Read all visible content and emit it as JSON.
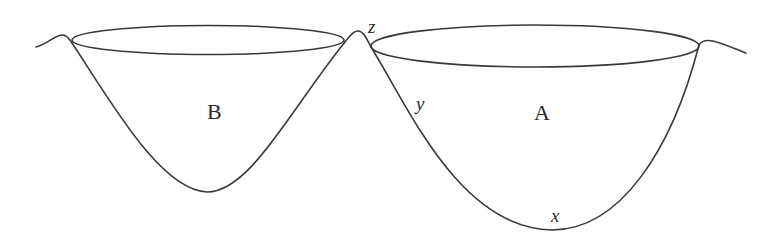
{
  "diagram": {
    "regions": [
      {
        "id": "B",
        "label": "B"
      },
      {
        "id": "A",
        "label": "A"
      }
    ],
    "points": [
      {
        "id": "z",
        "label": "z",
        "location": "ridge top between B and A"
      },
      {
        "id": "y",
        "label": "y",
        "location": "on the left slope of basin A"
      },
      {
        "id": "x",
        "label": "x",
        "location": "bottom of basin A"
      }
    ],
    "colors": {
      "line": "#3a3a3a",
      "text": "#2a2a2a",
      "background": "#ffffff"
    }
  }
}
